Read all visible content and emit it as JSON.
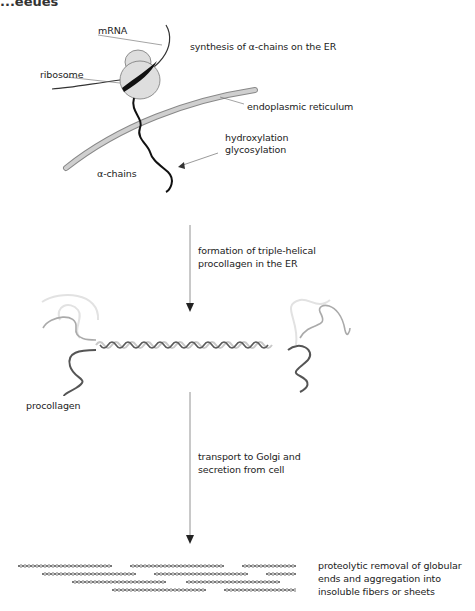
{
  "figure": {
    "top_cut_text": "...eeues",
    "stage1": {
      "title": "synthesis of α-chains on the ER",
      "labels": {
        "mrna": "mRNA",
        "ribosome": "ribosome",
        "er": "endoplasmic reticulum",
        "alpha_chains": "α-chains",
        "modification_line1": "hydroxylation",
        "modification_line2": "glycosylation"
      }
    },
    "step1": {
      "line1": "formation of triple-helical",
      "line2": "procollagen in the ER"
    },
    "stage2": {
      "label": "procollagen"
    },
    "step2": {
      "line1": "transport to Golgi and",
      "line2": "secretion from cell"
    },
    "stage3": {
      "line1": "proteolytic removal of globular",
      "line2": "ends and aggregation into",
      "line3": "insoluble fibers or sheets"
    }
  },
  "colors": {
    "er_membrane": "#b5b5b5",
    "ribosome": "#d9d9d9",
    "chain_dark": "#111111",
    "helix_dark": "#555555",
    "helix_light": "#c8c8c8",
    "arrow": "#444444"
  }
}
